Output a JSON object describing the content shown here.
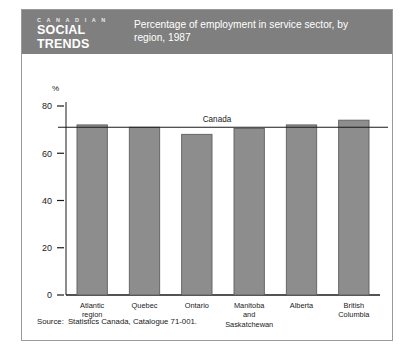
{
  "figure": {
    "brand": {
      "line1": "C A N A D I A N",
      "line2": "SOCIAL",
      "line3": "TRENDS"
    },
    "header_title": "Percentage of employment in service sector, by region, 1987",
    "source_label": "Source:",
    "source_value": "Statistics Canada, Catalogue 71-001.",
    "colors": {
      "header_band": "#7f7f7f",
      "bar_fill": "#8d8d8d",
      "bar_stroke": "#5e5e5e",
      "axis": "#1a1a1a",
      "border": "#9a9a9a"
    }
  },
  "chart_data": {
    "type": "bar",
    "title": "Percentage of employment in service sector, by region, 1987",
    "xlabel": "",
    "ylabel": "%",
    "ylim": [
      0,
      80
    ],
    "yticks": [
      0,
      20,
      40,
      60,
      80
    ],
    "ytick_labels": [
      "0",
      "20",
      "40",
      "60",
      "80"
    ],
    "grid": false,
    "legend": "none",
    "categories": [
      "Atlantic region",
      "Quebec",
      "Ontario",
      "Manitoba and Saskatchewan",
      "Alberta",
      "British Columbia"
    ],
    "category_lines": [
      [
        "Atlantic",
        "region"
      ],
      [
        "Quebec"
      ],
      [
        "Ontario"
      ],
      [
        "Manitoba",
        "and",
        "Saskatchewan"
      ],
      [
        "Alberta"
      ],
      [
        "British",
        "Columbia"
      ]
    ],
    "values": [
      72,
      71,
      68,
      70.5,
      72,
      74
    ],
    "annotations": [
      {
        "name": "canada-reference-line",
        "label": "Canada",
        "value": 71,
        "type": "horizontal-line"
      }
    ]
  }
}
